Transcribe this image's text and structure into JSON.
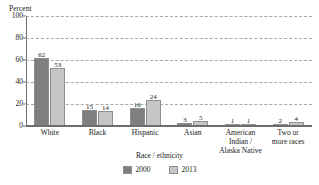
{
  "chart_data": {
    "type": "bar",
    "title": "",
    "xlabel": "Race / ethnicity",
    "ylabel": "Percent",
    "ylim": [
      0,
      100
    ],
    "yticks": [
      0,
      20,
      40,
      60,
      80,
      100
    ],
    "grid": true,
    "legend_position": "bottom-center",
    "categories": [
      "White",
      "Black",
      "Hispanic",
      "Asian",
      "American Indian / Alaska Native",
      "Two or more races"
    ],
    "category_lines": [
      [
        "White"
      ],
      [
        "Black"
      ],
      [
        "Hispanic"
      ],
      [
        "Asian"
      ],
      [
        "American Indian /",
        "Alaska Native"
      ],
      [
        "Two or",
        "more races"
      ]
    ],
    "series": [
      {
        "name": "2000",
        "color": "#7f7f7f",
        "values": [
          62,
          15,
          16,
          3,
          1,
          2
        ]
      },
      {
        "name": "2013",
        "color": "#c6c6c6",
        "values": [
          53,
          14,
          24,
          5,
          1,
          4
        ]
      }
    ]
  },
  "axis": {
    "y_title": "Percent",
    "y_tick_labels": [
      "0",
      "20",
      "40",
      "60",
      "80",
      "100"
    ],
    "x_title": "Race / ethnicity"
  },
  "legend": {
    "items": [
      {
        "label": "2000"
      },
      {
        "label": "2013"
      }
    ]
  },
  "colors": {
    "series_2000": "#7f7f7f",
    "series_2013": "#c6c6c6",
    "axis": "#6e6e6e",
    "gridline": "#a8a8a8",
    "text": "#1a1a1a",
    "background": "#ffffff"
  }
}
